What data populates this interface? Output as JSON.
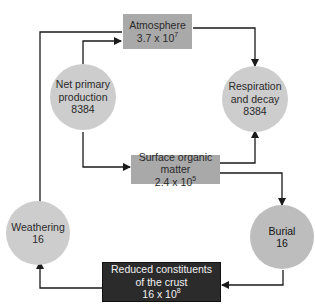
{
  "diagram": {
    "type": "carbon-cycle-flow",
    "nodes": {
      "atmosphere": {
        "label": "Atmosphere",
        "value_base": "3.7 x 10",
        "value_exp": "7",
        "shape": "box"
      },
      "net_primary_production": {
        "label_line1": "Net primary",
        "label_line2": "production",
        "value": "8384",
        "shape": "circle"
      },
      "respiration_decay": {
        "label_line1": "Respiration",
        "label_line2": "and decay",
        "value": "8384",
        "shape": "circle"
      },
      "surface_organic_matter": {
        "label": "Surface organic matter",
        "value_base": "2.4 x 10",
        "value_exp": "5",
        "shape": "box"
      },
      "weathering": {
        "label": "Weathering",
        "value": "16",
        "shape": "circle"
      },
      "burial": {
        "label": "Burial",
        "value": "16",
        "shape": "circle"
      },
      "reduced_crust": {
        "label_line1": "Reduced constituents",
        "label_line2": "of the crust",
        "value_base": "16 x 10",
        "value_exp": "8",
        "shape": "dark-box"
      }
    },
    "edges": [
      {
        "from": "net_primary_production",
        "to": "atmosphere",
        "note": "NPP draws from atmosphere"
      },
      {
        "from": "atmosphere",
        "to": "respiration_decay"
      },
      {
        "from": "net_primary_production",
        "to": "surface_organic_matter"
      },
      {
        "from": "surface_organic_matter",
        "to": "respiration_decay"
      },
      {
        "from": "surface_organic_matter",
        "to": "burial"
      },
      {
        "from": "burial",
        "to": "reduced_crust"
      },
      {
        "from": "reduced_crust",
        "to": "weathering"
      },
      {
        "from": "atmosphere",
        "to": "weathering",
        "note": "line from atmosphere down left side to weathering"
      }
    ],
    "colors": {
      "box": "#a9a9a9",
      "circle": "#cdcdcd",
      "dark_box": "#2b2b2b",
      "line": "#1a1a1a"
    }
  }
}
